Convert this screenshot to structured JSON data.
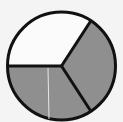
{
  "diagram": {
    "type": "fraction-circle",
    "total_parts": 3,
    "shaded_parts": 2,
    "fraction_shaded": "2/3",
    "colors": {
      "shaded": "#8f8f8f",
      "unshaded": "#fbfbfb",
      "outline": "#111111",
      "background": "#f4f4f4"
    },
    "sectors": [
      {
        "name": "top-left",
        "shaded": false
      },
      {
        "name": "right",
        "shaded": true
      },
      {
        "name": "bottom-left",
        "shaded": true
      }
    ]
  }
}
